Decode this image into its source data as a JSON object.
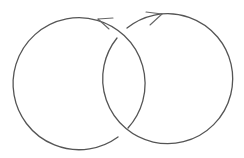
{
  "diagram": {
    "title": "Hopf link (two interlinked oriented circles)",
    "stroke_color": "#555555",
    "stroke_width": 1.3,
    "components": [
      {
        "name": "left-circle",
        "center": [
          80,
          84
        ],
        "radius": 66,
        "orientation": "counterclockwise",
        "arrow": {
          "at": [
            99,
            18
          ],
          "direction": "left"
        }
      },
      {
        "name": "right-circle",
        "center": [
          165,
          82
        ],
        "radius": 65,
        "orientation": "clockwise",
        "arrow": {
          "at": [
            162,
            14
          ],
          "direction": "right"
        }
      }
    ],
    "crossings": [
      {
        "position": "upper",
        "at": [
          122,
          33
        ],
        "over": "left-circle",
        "under": "right-circle"
      },
      {
        "position": "lower",
        "at": [
          125,
          131
        ],
        "over": "right-circle",
        "under": "left-circle"
      }
    ]
  }
}
